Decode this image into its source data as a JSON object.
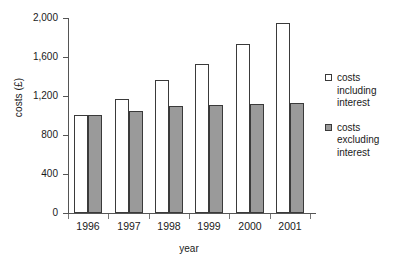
{
  "chart_data": {
    "type": "bar",
    "title": "",
    "xlabel": "year",
    "ylabel": "costs (£)",
    "categories": [
      "1996",
      "1997",
      "1998",
      "1999",
      "2000",
      "2001"
    ],
    "series": [
      {
        "name": "costs including interest",
        "values": [
          1000,
          1170,
          1360,
          1530,
          1730,
          1950
        ],
        "color": "#ffffff"
      },
      {
        "name": "costs excluding interest",
        "values": [
          1000,
          1050,
          1100,
          1105,
          1115,
          1130
        ],
        "color": "#9a9a9a"
      }
    ],
    "ylim": [
      0,
      2000
    ],
    "yticks": [
      0,
      400,
      800,
      1200,
      1600,
      2000
    ],
    "ytick_labels": [
      "0",
      "400",
      "800",
      "1,200",
      "1,600",
      "2,000"
    ],
    "grid": false,
    "legend_position": "right"
  },
  "legend": {
    "entries": [
      {
        "label": "costs including interest",
        "swatch": "white-square-swatch"
      },
      {
        "label": "costs excluding interest",
        "swatch": "gray-square-swatch"
      }
    ]
  },
  "axes": {
    "y_title": "costs (£)",
    "x_title": "year"
  },
  "caption": {
    "text": ""
  }
}
